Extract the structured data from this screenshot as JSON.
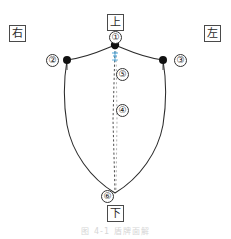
{
  "figure": {
    "caption": "图 4-1  盾牌面解",
    "direction_labels": [
      {
        "key": "top",
        "text": "上"
      },
      {
        "key": "left",
        "text": "右"
      },
      {
        "key": "right",
        "text": "左"
      },
      {
        "key": "bottom",
        "text": "下"
      }
    ],
    "callouts": [
      {
        "id": 1,
        "text": "①"
      },
      {
        "id": 2,
        "text": "②"
      },
      {
        "id": 3,
        "text": "③"
      },
      {
        "id": 4,
        "text": "④"
      },
      {
        "id": 5,
        "text": "⑤"
      },
      {
        "id": 6,
        "text": "⑥"
      }
    ],
    "colors": {
      "outline": "#2b2b2b",
      "vertex_dot": "#111111",
      "centerline": "#3a3a3a",
      "accent_mark": "#4da6d9",
      "box_border": "#4a4a4a",
      "caption": "#c9c9c9",
      "background": "#ffffff"
    },
    "geometry": {
      "apex": [
        115,
        45
      ],
      "shoulder_left": [
        67,
        60
      ],
      "shoulder_right": [
        163,
        60
      ],
      "bottom_point": [
        115,
        193
      ]
    }
  }
}
